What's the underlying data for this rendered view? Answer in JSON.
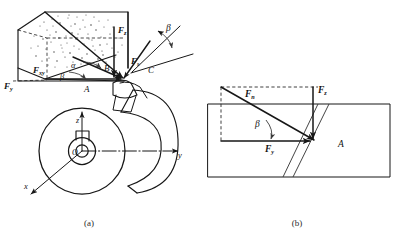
{
  "figure": {
    "captions": {
      "panel_a": "(a)",
      "panel_b": "(b)"
    },
    "colors": {
      "line": "#171717",
      "dashed": "#2a2a2a",
      "text": "#141414",
      "caption": "#2b2b2b",
      "background": "#ffffff"
    }
  },
  "panel_a": {
    "name": "(a)",
    "description": "Three-dimensional force parallelepiped at cutting point A on the workpiece, with resolved force components and cutting tool.",
    "force_labels": {
      "fz": {
        "symbol": "F",
        "subscript": "z"
      },
      "fy": {
        "symbol": "F",
        "subscript": "y"
      },
      "fxy": {
        "symbol": "F",
        "subscript": "xy"
      },
      "fs": {
        "symbol": "F",
        "subscript": "s"
      }
    },
    "angle_labels": {
      "alpha": "α",
      "beta_lower": "β",
      "beta_upper": "β"
    },
    "point_labels": {
      "a": "A",
      "b": "B",
      "c": "C",
      "o": "O"
    },
    "axis_labels": {
      "x": "x",
      "y": "y",
      "z": "z"
    }
  },
  "panel_b": {
    "name": "(b)",
    "description": "Planar view of the unrolled cut surface showing the normal force and its z and y components relative to the helix angle.",
    "force_labels": {
      "fn": {
        "symbol": "F",
        "subscript": "n"
      },
      "fz": {
        "symbol": "F",
        "subscript": "z"
      },
      "fy": {
        "symbol": "F",
        "subscript": "y"
      }
    },
    "angle_labels": {
      "beta": "β"
    },
    "region_labels": {
      "a": "A"
    }
  }
}
